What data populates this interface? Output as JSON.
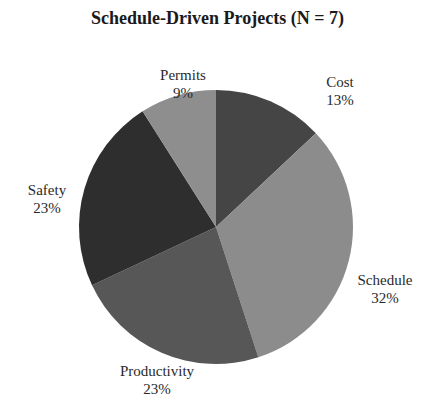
{
  "chart_data": {
    "type": "pie",
    "title": "Schedule-Driven Projects (N = 7)",
    "start_angle": "12 o'clock, clockwise",
    "categories": [
      "Cost",
      "Schedule",
      "Productivity",
      "Safety",
      "Permits"
    ],
    "values": [
      13,
      32,
      23,
      23,
      9
    ],
    "value_labels": [
      "13%",
      "32%",
      "23%",
      "23%",
      "9%"
    ],
    "colors": [
      "#454545",
      "#8c8c8c",
      "#575757",
      "#2e2e2e",
      "#8e8e8e"
    ],
    "legend": "none (labels outside slices)"
  }
}
